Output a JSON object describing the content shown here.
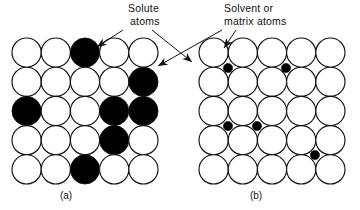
{
  "figure": {
    "title_visible": false,
    "background_color": "#ffffff",
    "line_color": "#111111",
    "fill_solute_color": "#000000",
    "fill_matrix_color": "#ffffff"
  },
  "annotations": {
    "solute": {
      "line1": "Solute",
      "line2": "atoms",
      "x": 128,
      "y": 12
    },
    "solvent": {
      "line1": "Solvent or",
      "line2": "matrix atoms",
      "x": 224,
      "y": 12
    }
  },
  "panels": [
    {
      "id": "a",
      "caption": "(a)",
      "caption_x": 66,
      "caption_y": 199,
      "type": "substitutional",
      "origin_x": 12,
      "origin_y": 38,
      "radius": 14.6,
      "step_x": 29.2,
      "step_y": 29.2,
      "rows": 5,
      "cols": 5,
      "solute_cells": [
        [
          0,
          2
        ],
        [
          1,
          4
        ],
        [
          2,
          0
        ],
        [
          2,
          3
        ],
        [
          2,
          4
        ],
        [
          3,
          3
        ],
        [
          4,
          2
        ]
      ]
    },
    {
      "id": "b",
      "caption": "(b)",
      "caption_x": 256,
      "caption_y": 199,
      "type": "interstitial",
      "origin_x": 199,
      "origin_y": 38,
      "radius": 14.6,
      "step_x": 29.2,
      "step_y": 29.2,
      "rows": 5,
      "cols": 5,
      "solute_cells": [],
      "interstitials": [
        {
          "x": 228,
          "y": 68,
          "r": 4.6
        },
        {
          "x": 286,
          "y": 68,
          "r": 4.6
        },
        {
          "x": 228,
          "y": 126,
          "r": 4.6
        },
        {
          "x": 257,
          "y": 126,
          "r": 4.6
        },
        {
          "x": 315,
          "y": 155,
          "r": 4.6
        }
      ]
    }
  ],
  "leaders": [
    {
      "name": "solute-to-panel-a",
      "path": "M 123 30 L 97 47",
      "arrow_at": [
        97,
        47
      ],
      "arrow_angle": 146
    },
    {
      "name": "solute-to-panel-b-cross",
      "path": "M 152 30 L 192 62",
      "arrow_at": [
        192,
        62
      ],
      "arrow_angle": 39
    },
    {
      "name": "solvent-to-panel-a-cross",
      "path": "M 222 30 L 158 66",
      "arrow_at": [
        158,
        66
      ],
      "arrow_angle": 151
    },
    {
      "name": "solvent-to-panel-b",
      "path": "M 236 30 L 224 48",
      "arrow_at": [
        224,
        48
      ],
      "arrow_angle": 124
    }
  ]
}
